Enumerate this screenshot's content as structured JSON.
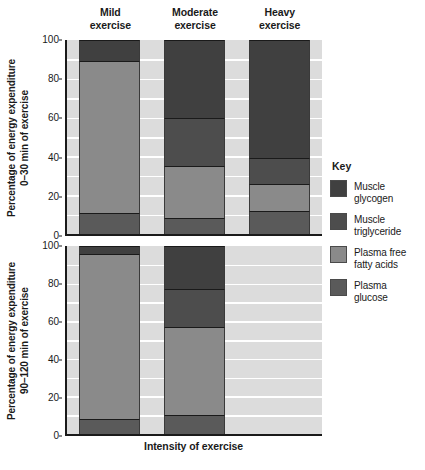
{
  "chart_data": {
    "type": "bar",
    "subtype": "stacked-bar",
    "title": "",
    "xlabel": "Intensity of exercise",
    "categories": [
      "Mild exercise",
      "Moderate exercise",
      "Heavy exercise"
    ],
    "legend_position": "right",
    "grid": true,
    "panels": [
      {
        "id": "panel-top",
        "ylabel": "Percentage of energy expenditure\n0–30 min of exercise",
        "ylim": [
          0,
          100
        ],
        "yticks": [
          0,
          20,
          40,
          60,
          80,
          100
        ],
        "ytick_labels": [
          "0",
          "20",
          "40",
          "60",
          "80",
          "100"
        ],
        "series": [
          {
            "name": "Plasma glucose",
            "values": [
              11,
              8,
              12
            ]
          },
          {
            "name": "Plasma free fatty acids",
            "values": [
              78,
              27,
              14
            ]
          },
          {
            "name": "Muscle triglyceride",
            "values": [
              0,
              25,
              13
            ]
          },
          {
            "name": "Muscle glycogen",
            "values": [
              11,
              40,
              61
            ]
          }
        ],
        "boundaries": {
          "Mild exercise": [
            0,
            11,
            89,
            89,
            100
          ],
          "Moderate exercise": [
            0,
            8,
            35,
            60,
            100
          ],
          "Heavy exercise": [
            0,
            12,
            26,
            39,
            100
          ]
        }
      },
      {
        "id": "panel-bottom",
        "ylabel": "Percentage of energy expenditure\n90–120 min of exercise",
        "ylim": [
          0,
          100
        ],
        "yticks": [
          0,
          20,
          40,
          60,
          80,
          100
        ],
        "ytick_labels": [
          "0",
          "20",
          "40",
          "60",
          "80",
          "100"
        ],
        "series": [
          {
            "name": "Plasma glucose",
            "values": [
              8,
              10,
              null
            ]
          },
          {
            "name": "Plasma free fatty acids",
            "values": [
              88,
              47,
              null
            ]
          },
          {
            "name": "Muscle triglyceride",
            "values": [
              0,
              20,
              null
            ]
          },
          {
            "name": "Muscle glycogen",
            "values": [
              4,
              23,
              null
            ]
          }
        ],
        "boundaries": {
          "Mild exercise": [
            0,
            8,
            96,
            96,
            100
          ],
          "Moderate exercise": [
            0,
            10,
            57,
            77,
            100
          ],
          "Heavy exercise": null
        }
      }
    ],
    "colors": {
      "muscle_glycogen": "#404040",
      "muscle_triglyceride": "#4d4d4d",
      "plasma_free_fatty_acids": "#8a8a8a",
      "plasma_glucose": "#5a5a5a",
      "plot_background": "#dcdcdc",
      "gridline": "#ffffff",
      "axis": "#1a1a1a"
    }
  },
  "headers": [
    {
      "line1": "Mild",
      "line2": "exercise"
    },
    {
      "line1": "Moderate",
      "line2": "exercise"
    },
    {
      "line1": "Heavy",
      "line2": "exercise"
    }
  ],
  "legend": {
    "title": "Key",
    "items": [
      {
        "label": "Muscle\nglycogen",
        "color": "#404040"
      },
      {
        "label": "Muscle\ntriglyceride",
        "color": "#4d4d4d"
      },
      {
        "label": "Plasma free\nfatty acids",
        "color": "#8a8a8a"
      },
      {
        "label": "Plasma\nglucose",
        "color": "#5a5a5a"
      }
    ]
  },
  "xaxis": {
    "label": "Intensity of exercise"
  }
}
